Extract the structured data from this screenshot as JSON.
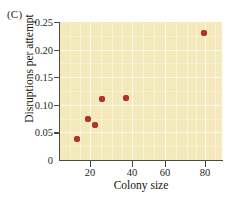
{
  "panel": {
    "label": "(C)"
  },
  "colors": {
    "plot_background": "#f3e9bb",
    "point": "#b5322a",
    "axis": "#4a4a47",
    "gridline": "#ffffff",
    "page_background": "#ffffff"
  },
  "chart_data": {
    "type": "scatter",
    "title": "(C)",
    "xlabel": "Colony size",
    "ylabel": "Disruptions per attempt",
    "xtick_labels": [
      "20",
      "40",
      "60",
      "80"
    ],
    "xtick_values": [
      20,
      40,
      60,
      80
    ],
    "ytick_labels": [
      "0",
      "0.05",
      "0.10",
      "0.15",
      "0.20",
      "0.25"
    ],
    "ytick_values": [
      0,
      0.05,
      0.1,
      0.15,
      0.2,
      0.25
    ],
    "ylim": [
      0,
      0.25
    ],
    "xlim": [
      5,
      95
    ],
    "x_scale": "compressed",
    "grid": true,
    "legend": null,
    "series": [
      {
        "name": "Colonies",
        "marker": "filled-circle",
        "color": "#b5322a",
        "points": [
          {
            "x": 12,
            "y": 0.035
          },
          {
            "x": 18,
            "y": 0.071
          },
          {
            "x": 21,
            "y": 0.059
          },
          {
            "x": 26,
            "y": 0.11
          },
          {
            "x": 37,
            "y": 0.114
          },
          {
            "x": 79,
            "y": 0.238
          }
        ]
      }
    ]
  },
  "pixel_layout": {
    "ytick_pixels": [
      160,
      132.4,
      104.8,
      77.2,
      49.6,
      22
    ],
    "xtick_pixels": [
      90,
      132,
      165,
      205
    ],
    "point_pixels": [
      {
        "cx": 77,
        "cy": 139
      },
      {
        "cx": 88,
        "cy": 119
      },
      {
        "cx": 95,
        "cy": 125
      },
      {
        "cx": 102,
        "cy": 99
      },
      {
        "cx": 126,
        "cy": 98
      },
      {
        "cx": 204,
        "cy": 33
      }
    ]
  }
}
